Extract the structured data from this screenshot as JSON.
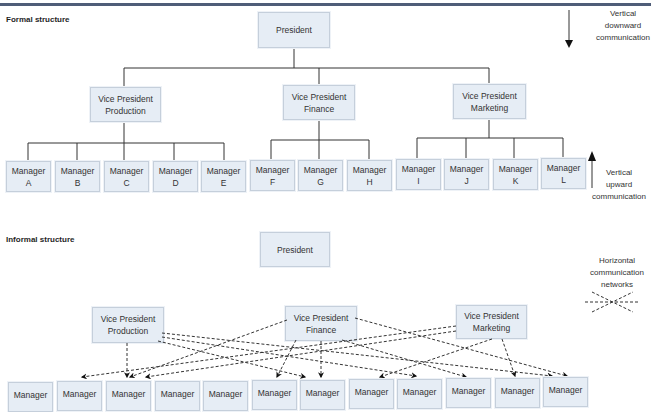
{
  "formal": {
    "title": "Formal structure",
    "president": "President",
    "vps": [
      {
        "line1": "Vice President",
        "line2": "Production"
      },
      {
        "line1": "Vice President",
        "line2": "Finance"
      },
      {
        "line1": "Vice President",
        "line2": "Marketing"
      }
    ],
    "managers": [
      {
        "line1": "Manager",
        "line2": "A"
      },
      {
        "line1": "Manager",
        "line2": "B"
      },
      {
        "line1": "Manager",
        "line2": "C"
      },
      {
        "line1": "Manager",
        "line2": "D"
      },
      {
        "line1": "Manager",
        "line2": "E"
      },
      {
        "line1": "Manager",
        "line2": "F"
      },
      {
        "line1": "Manager",
        "line2": "G"
      },
      {
        "line1": "Manager",
        "line2": "H"
      },
      {
        "line1": "Manager",
        "line2": "I"
      },
      {
        "line1": "Manager",
        "line2": "J"
      },
      {
        "line1": "Manager",
        "line2": "K"
      },
      {
        "line1": "Manager",
        "line2": "L"
      }
    ],
    "downward_note": {
      "line1": "Vertical",
      "line2": "downward",
      "line3": "communication"
    },
    "upward_note": {
      "line1": "Vertical",
      "line2": "upward",
      "line3": "communication"
    }
  },
  "informal": {
    "title": "Informal structure",
    "president": "President",
    "vps": [
      {
        "line1": "Vice President",
        "line2": "Production"
      },
      {
        "line1": "Vice President",
        "line2": "Finance"
      },
      {
        "line1": "Vice President",
        "line2": "Marketing"
      }
    ],
    "managers": [
      "Manager",
      "Manager",
      "Manager",
      "Manager",
      "Manager",
      "Manager",
      "Manager",
      "Manager",
      "Manager",
      "Manager",
      "Manager",
      "Manager"
    ],
    "horizontal_note": {
      "line1": "Horizontal",
      "line2": "communication",
      "line3": "networks"
    }
  }
}
